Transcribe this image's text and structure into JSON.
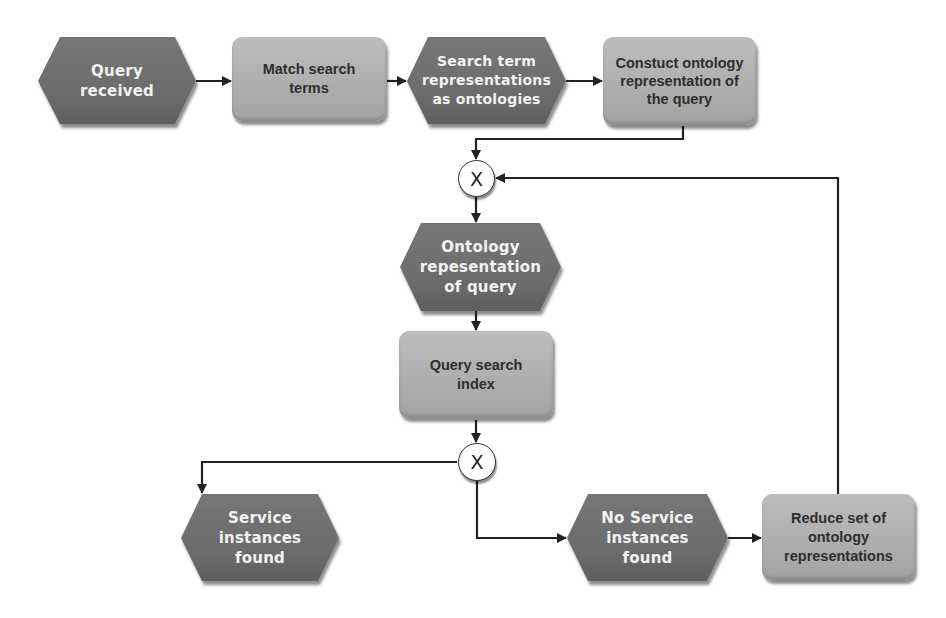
{
  "diagram": {
    "type": "EPC process flow",
    "colors": {
      "event_fill": "#6e6e6e",
      "function_fill": "#b3b3b3",
      "connector_fill": "#ffffff",
      "edge": "#222222",
      "background": "#ffffff"
    },
    "nodes": {
      "query_received": {
        "kind": "event",
        "label": "Query received",
        "lines": [
          "Query",
          "received"
        ]
      },
      "match_search_terms": {
        "kind": "function",
        "label": "Match search terms",
        "lines": [
          "Match search",
          "terms"
        ]
      },
      "search_term_representations": {
        "kind": "event",
        "label": "Search term representations as ontologies",
        "lines": [
          "Search term",
          "representations",
          "as ontologies"
        ]
      },
      "construct_ontology": {
        "kind": "function",
        "label": "Constuct ontology representation of the query",
        "lines": [
          "Constuct",
          "ontology",
          "representation",
          "of the query"
        ]
      },
      "xor_merge": {
        "kind": "connector",
        "label": "X"
      },
      "ontology_representation": {
        "kind": "event",
        "label": "Ontology repesentation of query",
        "lines": [
          "Ontology",
          "repesentation",
          "of query"
        ]
      },
      "query_search_index": {
        "kind": "function",
        "label": "Query search index",
        "lines": [
          "Query search",
          "index"
        ]
      },
      "xor_split": {
        "kind": "connector",
        "label": "X"
      },
      "service_found": {
        "kind": "event",
        "label": "Service instances found",
        "lines": [
          "Service",
          "instances",
          "found"
        ]
      },
      "no_service_found": {
        "kind": "event",
        "label": "No Service instances found",
        "lines": [
          "No Service",
          "instances",
          "found"
        ]
      },
      "reduce_set": {
        "kind": "function",
        "label": "Reduce set of ontology representations",
        "lines": [
          "Reduce set of",
          "ontology",
          "representations"
        ]
      }
    },
    "edges": [
      {
        "from": "query_received",
        "to": "match_search_terms"
      },
      {
        "from": "match_search_terms",
        "to": "search_term_representations"
      },
      {
        "from": "search_term_representations",
        "to": "construct_ontology"
      },
      {
        "from": "construct_ontology",
        "to": "xor_merge"
      },
      {
        "from": "xor_merge",
        "to": "ontology_representation"
      },
      {
        "from": "ontology_representation",
        "to": "query_search_index"
      },
      {
        "from": "query_search_index",
        "to": "xor_split"
      },
      {
        "from": "xor_split",
        "to": "service_found"
      },
      {
        "from": "xor_split",
        "to": "no_service_found"
      },
      {
        "from": "no_service_found",
        "to": "reduce_set"
      },
      {
        "from": "reduce_set",
        "to": "xor_merge"
      }
    ]
  }
}
